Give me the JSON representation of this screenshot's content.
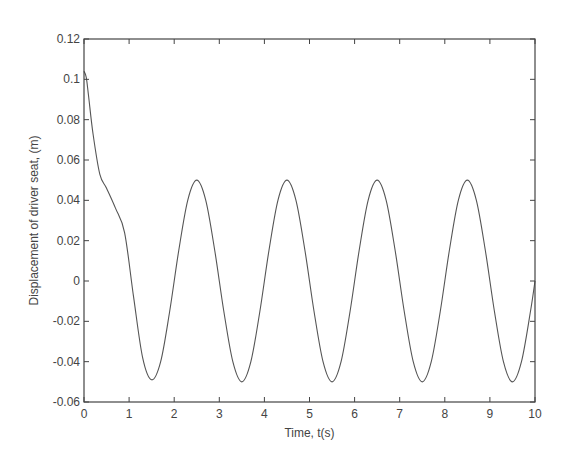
{
  "chart_data": {
    "type": "line",
    "title": "",
    "xlabel": "Time, t(s)",
    "ylabel": "Displacement of driver seat, (m)",
    "xlim": [
      0,
      10
    ],
    "ylim": [
      -0.06,
      0.12
    ],
    "xticks": [
      0,
      1,
      2,
      3,
      4,
      5,
      6,
      7,
      8,
      9,
      10
    ],
    "xtick_labels": [
      "0",
      "1",
      "2",
      "3",
      "4",
      "5",
      "6",
      "7",
      "8",
      "9",
      "10"
    ],
    "yticks": [
      -0.06,
      -0.04,
      -0.02,
      0,
      0.02,
      0.04,
      0.06,
      0.08,
      0.1,
      0.12
    ],
    "ytick_labels": [
      "-0.06",
      "-0.04",
      "-0.02",
      "0",
      "0.02",
      "0.04",
      "0.06",
      "0.08",
      "0.1",
      "0.12"
    ],
    "grid": false,
    "legend": null,
    "series": [
      {
        "name": "driver seat displacement",
        "color": "#555555",
        "x": [
          0,
          0.05,
          0.1,
          0.2,
          0.35,
          0.5,
          0.7,
          0.9,
          1.1,
          1.3,
          1.5,
          1.7,
          1.9,
          2.1,
          2.3,
          2.5,
          2.7,
          2.9,
          3.1,
          3.3,
          3.5,
          3.7,
          3.9,
          4.1,
          4.3,
          4.5,
          4.7,
          4.9,
          5.1,
          5.3,
          5.5,
          5.7,
          5.9,
          6.1,
          6.3,
          6.5,
          6.7,
          6.9,
          7.1,
          7.3,
          7.5,
          7.7,
          7.9,
          8.1,
          8.3,
          8.5,
          8.7,
          8.9,
          9.1,
          9.3,
          9.5,
          9.7,
          9.9,
          10
        ],
        "y": [
          0.104,
          0.101,
          0.092,
          0.073,
          0.053,
          0.046,
          0.036,
          0.024,
          -0.008,
          -0.038,
          -0.049,
          -0.04,
          -0.015,
          0.015,
          0.04,
          0.05,
          0.04,
          0.015,
          -0.015,
          -0.04,
          -0.05,
          -0.04,
          -0.015,
          0.015,
          0.04,
          0.05,
          0.04,
          0.015,
          -0.015,
          -0.04,
          -0.05,
          -0.04,
          -0.015,
          0.015,
          0.04,
          0.05,
          0.04,
          0.015,
          -0.015,
          -0.04,
          -0.05,
          -0.04,
          -0.015,
          0.015,
          0.04,
          0.05,
          0.04,
          0.015,
          -0.015,
          -0.04,
          -0.05,
          -0.04,
          -0.015,
          0.0
        ]
      }
    ]
  }
}
